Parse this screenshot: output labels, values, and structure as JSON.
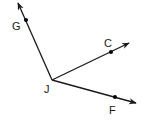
{
  "diagram": {
    "type": "rays-from-vertex",
    "vertex": {
      "label": "J",
      "x": 52,
      "y": 80,
      "label_x": 44,
      "label_y": 93
    },
    "rays": [
      {
        "name": "ray-JG",
        "point_label": "G",
        "point": {
          "x": 26,
          "y": 20
        },
        "tip": {
          "x": 18,
          "y": 3
        },
        "label_pos": {
          "x": 12,
          "y": 30
        }
      },
      {
        "name": "ray-JC",
        "point_label": "C",
        "point": {
          "x": 111,
          "y": 52
        },
        "tip": {
          "x": 129,
          "y": 43
        },
        "label_pos": {
          "x": 104,
          "y": 47
        }
      },
      {
        "name": "ray-JF",
        "point_label": "F",
        "point": {
          "x": 115,
          "y": 97
        },
        "tip": {
          "x": 136,
          "y": 103
        },
        "label_pos": {
          "x": 109,
          "y": 114
        }
      }
    ],
    "colors": {
      "line": "#1a1a1a",
      "point": "#000000",
      "background": "#ffffff"
    }
  }
}
